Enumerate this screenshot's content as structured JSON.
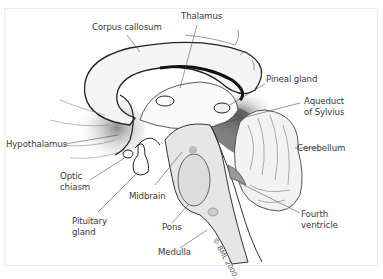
{
  "diagram": {
    "credit": "© BML 2000",
    "labels": {
      "corpus_callosum": "Corpus callosum",
      "thalamus": "Thalamus",
      "pineal_gland": "Pineal gland",
      "aqueduct_of_sylvius": "Aqueduct\nof Sylvius",
      "hypothalamus": "Hypothalamus",
      "cerebellum": "Cerebellum",
      "optic_chiasm": "Optic\nchiasm",
      "midbrain": "Midbrain",
      "pituitary_gland": "Pituitary\ngland",
      "pons": "Pons",
      "fourth_ventricle": "Fourth\nventricle",
      "medulla": "Medulla"
    }
  }
}
